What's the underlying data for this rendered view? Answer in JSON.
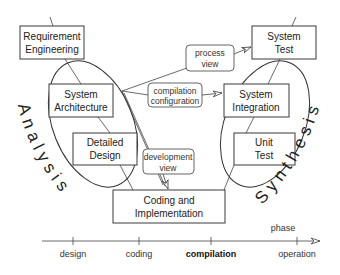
{
  "diagram": {
    "left_label": "Analysis",
    "right_label": "Synthesis",
    "boxes": {
      "requirement_engineering": [
        "Requirement",
        "Engineering"
      ],
      "system_architecture": [
        "System",
        "Architecture"
      ],
      "detailed_design": [
        "Detailed",
        "Design"
      ],
      "coding_implementation": [
        "Coding and",
        "Implementation"
      ],
      "unit_test": [
        "Unit",
        "Test"
      ],
      "system_integration": [
        "System",
        "Integration"
      ],
      "system_test": [
        "System",
        "Test"
      ]
    },
    "views": {
      "process_view": [
        "process",
        "view"
      ],
      "compilation_configuration": [
        "compilation",
        "configuration"
      ],
      "development_view": [
        "development",
        "view"
      ]
    },
    "timeline": {
      "axis_label": "phase",
      "ticks": [
        "design",
        "coding",
        "compilation",
        "operation"
      ],
      "highlighted_tick": "compilation"
    }
  }
}
